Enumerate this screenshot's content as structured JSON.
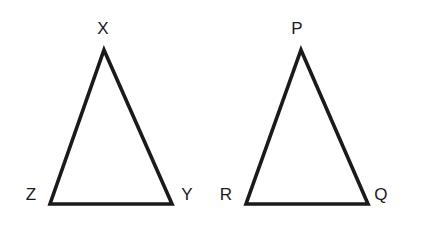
{
  "figure": {
    "canvas": {
      "width": 427,
      "height": 235
    },
    "background_color": "#ffffff",
    "stroke_color": "#1a1a1a",
    "stroke_width": 3.6,
    "label_color": "#1a1a1a",
    "label_font_size": 17
  },
  "chart_data": {
    "type": "diagram",
    "subtype": "geometry-triangles",
    "grid": false,
    "legend": null,
    "xlabel": "",
    "ylabel": "",
    "shapes": [
      {
        "name": "triangle-xzy",
        "kind": "triangle",
        "vertices": [
          {
            "label": "X",
            "x": 104,
            "y": 50
          },
          {
            "label": "Y",
            "x": 172,
            "y": 204
          },
          {
            "label": "Z",
            "x": 50,
            "y": 204
          }
        ],
        "base_length_px": 122,
        "height_px": 154,
        "filled": false
      },
      {
        "name": "triangle-prq",
        "kind": "triangle",
        "vertices": [
          {
            "label": "P",
            "x": 301,
            "y": 50
          },
          {
            "label": "Q",
            "x": 368,
            "y": 204
          },
          {
            "label": "R",
            "x": 246,
            "y": 204
          }
        ],
        "base_length_px": 122,
        "height_px": 154,
        "filled": false
      }
    ]
  },
  "triangles": [
    {
      "id": "triangle-xzy",
      "path": "M 104 50 L 172 204 L 50 204 Z",
      "labels": {
        "apex": {
          "text": "X",
          "x": 103,
          "y": 28
        },
        "bottom_left": {
          "text": "Z",
          "x": 31,
          "y": 194
        },
        "bottom_right": {
          "text": "Y",
          "x": 187,
          "y": 194
        }
      }
    },
    {
      "id": "triangle-prq",
      "path": "M 301 50 L 368 204 L 246 204 Z",
      "labels": {
        "apex": {
          "text": "P",
          "x": 297,
          "y": 28
        },
        "bottom_left": {
          "text": "R",
          "x": 226,
          "y": 194
        },
        "bottom_right": {
          "text": "Q",
          "x": 381,
          "y": 194
        }
      }
    }
  ]
}
